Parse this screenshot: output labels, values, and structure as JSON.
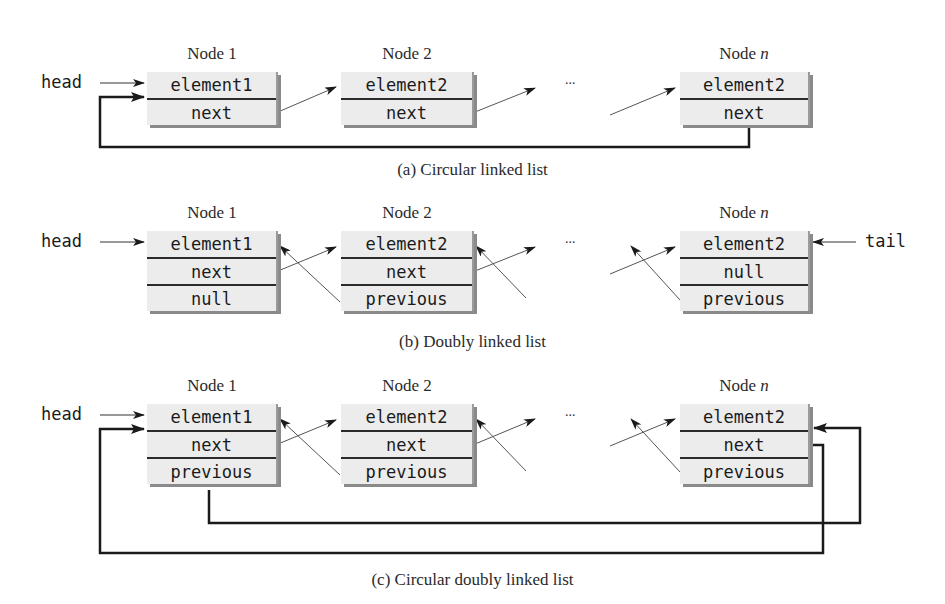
{
  "diagram_a": {
    "caption": "(a) Circular linked list",
    "head_label": "head",
    "nodes": [
      {
        "title": "Node 1",
        "title_suffix": "",
        "fields": [
          "element1",
          "next"
        ]
      },
      {
        "title": "Node 2",
        "title_suffix": "",
        "fields": [
          "element2",
          "next"
        ]
      },
      {
        "title": "Node ",
        "title_suffix": "n",
        "fields": [
          "element2",
          "next"
        ]
      }
    ],
    "ellipsis": "..."
  },
  "diagram_b": {
    "caption": "(b) Doubly linked list",
    "head_label": "head",
    "tail_label": "tail",
    "nodes": [
      {
        "title": "Node 1",
        "title_suffix": "",
        "fields": [
          "element1",
          "next",
          "null"
        ]
      },
      {
        "title": "Node 2",
        "title_suffix": "",
        "fields": [
          "element2",
          "next",
          "previous"
        ]
      },
      {
        "title": "Node ",
        "title_suffix": "n",
        "fields": [
          "element2",
          "null",
          "previous"
        ]
      }
    ],
    "ellipsis": "..."
  },
  "diagram_c": {
    "caption": "(c) Circular doubly linked list",
    "head_label": "head",
    "nodes": [
      {
        "title": "Node 1",
        "title_suffix": "",
        "fields": [
          "element1",
          "next",
          "previous"
        ]
      },
      {
        "title": "Node 2",
        "title_suffix": "",
        "fields": [
          "element2",
          "next",
          "previous"
        ]
      },
      {
        "title": "Node ",
        "title_suffix": "n",
        "fields": [
          "element2",
          "next",
          "previous"
        ]
      }
    ],
    "ellipsis": "..."
  }
}
